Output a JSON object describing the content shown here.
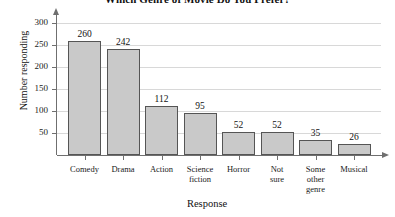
{
  "chart_data": {
    "type": "bar",
    "title": "Which Genre of Movie Do You Prefer?",
    "xlabel": "Response",
    "ylabel": "Number responding",
    "categories": [
      "Comedy",
      "Drama",
      "Action",
      "Science fiction",
      "Horror",
      "Not sure",
      "Some other genre",
      "Musical"
    ],
    "values": [
      260,
      242,
      112,
      95,
      52,
      52,
      35,
      26
    ],
    "ylim": [
      0,
      300
    ],
    "yticks": [
      50,
      100,
      150,
      200,
      250,
      300
    ],
    "ytick_labels": [
      "50",
      "100",
      "150",
      "200",
      "250",
      "300"
    ],
    "value_labels": [
      "260",
      "242",
      "112",
      "95",
      "52",
      "52",
      "35",
      "26"
    ],
    "category_labels": [
      "Comedy",
      "Drama",
      "Action",
      "Science\nfiction",
      "Horror",
      "Not\nsure",
      "Some\nother\ngenre",
      "Musical"
    ],
    "grid": true,
    "legend": null,
    "bar_color": "#c9c9c9",
    "bar_edge_color": "#555555",
    "axis_color": "#6f6f6f",
    "gridline_color": "#d8d8d8",
    "background": "#ffffff"
  }
}
